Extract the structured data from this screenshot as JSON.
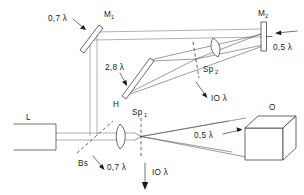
{
  "diagram": {
    "background_color": "#ffffff",
    "line_color": "#2a2a2a",
    "components": [
      {
        "id": "L",
        "name": "laser",
        "label": "L",
        "sub": ""
      },
      {
        "id": "Bs",
        "name": "beam-splitter",
        "label": "Bs",
        "sub": ""
      },
      {
        "id": "M1",
        "name": "mirror-1",
        "label": "M",
        "sub": "1"
      },
      {
        "id": "M2",
        "name": "mirror-2",
        "label": "M",
        "sub": "2"
      },
      {
        "id": "H",
        "name": "hologram",
        "label": "H",
        "sub": ""
      },
      {
        "id": "Sp1",
        "name": "spatial-filter-1",
        "label": "Sp",
        "sub": "1"
      },
      {
        "id": "Sp2",
        "name": "spatial-filter-2",
        "label": "Sp",
        "sub": "2"
      },
      {
        "id": "O",
        "name": "object-cube",
        "label": "O",
        "sub": ""
      }
    ],
    "annotations": [
      {
        "id": "a1",
        "text": "0,7 λ",
        "near": "M1",
        "arrow": "down-right"
      },
      {
        "id": "a2",
        "text": "0,5 λ",
        "near": "M2",
        "arrow": "up-left"
      },
      {
        "id": "a3",
        "text": "2,8 λ",
        "near": "H",
        "arrow": "down-right"
      },
      {
        "id": "a4",
        "text": "IO λ",
        "near": "Sp2",
        "arrow": "down-right"
      },
      {
        "id": "a5",
        "text": "0,7 λ",
        "near": "Bs",
        "arrow": "down-right"
      },
      {
        "id": "a6",
        "text": "IO λ",
        "near": "Sp1",
        "arrow": "down"
      },
      {
        "id": "a7",
        "text": "0,5 λ",
        "near": "O",
        "arrow": "right"
      }
    ]
  }
}
